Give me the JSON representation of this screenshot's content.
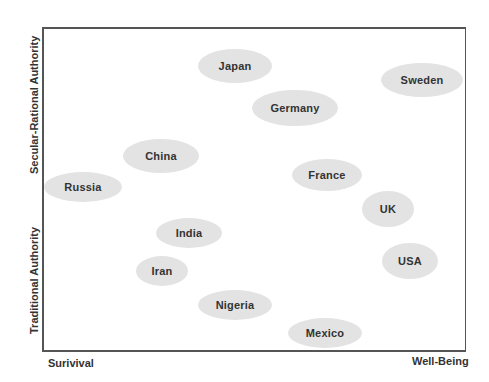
{
  "axes": {
    "y_top_label": "Secular-Rational Authority",
    "y_bottom_label": "Traditional Authority",
    "x_left_label": "Surivival",
    "x_right_label": "Well-Being"
  },
  "colors": {
    "ellipse_fill": "#e3e3e3",
    "border": "#555555",
    "text": "#333333"
  },
  "countries": [
    {
      "name": "Japan",
      "cx": 235,
      "cy": 66,
      "w": 74,
      "h": 34
    },
    {
      "name": "Germany",
      "cx": 295,
      "cy": 108,
      "w": 86,
      "h": 36
    },
    {
      "name": "Sweden",
      "cx": 422,
      "cy": 80,
      "w": 82,
      "h": 34
    },
    {
      "name": "China",
      "cx": 161,
      "cy": 156,
      "w": 76,
      "h": 34
    },
    {
      "name": "Russia",
      "cx": 83,
      "cy": 187,
      "w": 78,
      "h": 30
    },
    {
      "name": "France",
      "cx": 327,
      "cy": 175,
      "w": 70,
      "h": 32
    },
    {
      "name": "UK",
      "cx": 388,
      "cy": 209,
      "w": 52,
      "h": 36
    },
    {
      "name": "India",
      "cx": 189,
      "cy": 233,
      "w": 66,
      "h": 30
    },
    {
      "name": "USA",
      "cx": 410,
      "cy": 261,
      "w": 56,
      "h": 36
    },
    {
      "name": "Iran",
      "cx": 162,
      "cy": 271,
      "w": 52,
      "h": 30
    },
    {
      "name": "Nigeria",
      "cx": 235,
      "cy": 305,
      "w": 74,
      "h": 30
    },
    {
      "name": "Mexico",
      "cx": 325,
      "cy": 333,
      "w": 74,
      "h": 30
    }
  ]
}
